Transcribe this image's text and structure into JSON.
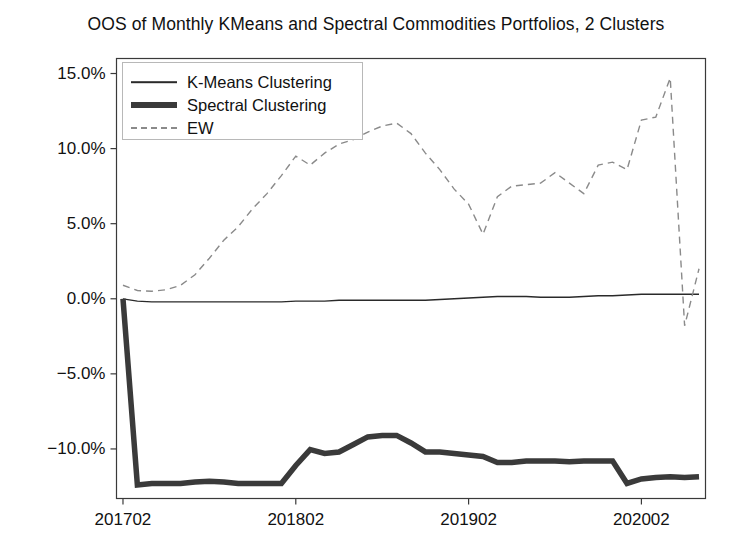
{
  "chart_data": {
    "type": "line",
    "title": "OOS of Monthly KMeans and Spectral Commodities Portfolios, 2 Clusters",
    "xlabel": "",
    "ylabel": "",
    "grid": false,
    "legend_position": "upper left",
    "xlim": [
      201701,
      202006
    ],
    "ylim": [
      -13.3,
      16.0
    ],
    "ytick_labels": [
      "15.0%",
      "10.0%",
      "5.0%",
      "0.0%",
      "−5.0%",
      "−10.0%"
    ],
    "ytick_values": [
      15.0,
      10.0,
      5.0,
      0.0,
      -5.0,
      -10.0
    ],
    "xtick_labels": [
      "201702",
      "201802",
      "201902",
      "202002"
    ],
    "xtick_values": [
      201702,
      201802,
      201902,
      202002
    ],
    "x": [
      "201702",
      "201703",
      "201704",
      "201705",
      "201706",
      "201707",
      "201708",
      "201709",
      "201710",
      "201711",
      "201712",
      "201801",
      "201802",
      "201803",
      "201804",
      "201805",
      "201806",
      "201807",
      "201808",
      "201809",
      "201810",
      "201811",
      "201812",
      "201901",
      "201902",
      "201903",
      "201904",
      "201905",
      "201906",
      "201907",
      "201908",
      "201909",
      "201910",
      "201911",
      "201912",
      "202001",
      "202002",
      "202003",
      "202004",
      "202005",
      "202006"
    ],
    "series": [
      {
        "name": "K-Means Clustering",
        "style": "solid",
        "width": 1.3,
        "color": "#2a2a2a",
        "values": [
          0.0,
          -0.15,
          -0.2,
          -0.2,
          -0.2,
          -0.2,
          -0.2,
          -0.2,
          -0.2,
          -0.2,
          -0.2,
          -0.2,
          -0.15,
          -0.15,
          -0.15,
          -0.1,
          -0.1,
          -0.1,
          -0.1,
          -0.1,
          -0.1,
          -0.1,
          -0.05,
          0.0,
          0.05,
          0.1,
          0.15,
          0.15,
          0.15,
          0.1,
          0.1,
          0.1,
          0.15,
          0.2,
          0.2,
          0.25,
          0.3,
          0.3,
          0.3,
          0.3,
          0.3
        ]
      },
      {
        "name": "Spectral Clustering",
        "style": "solid",
        "width": 5.5,
        "color": "#3a3a3a",
        "values": [
          0.0,
          -12.4,
          -12.3,
          -12.3,
          -12.3,
          -12.2,
          -12.15,
          -12.2,
          -12.3,
          -12.3,
          -12.3,
          -12.3,
          -11.1,
          -10.05,
          -10.3,
          -10.2,
          -9.7,
          -9.2,
          -9.1,
          -9.1,
          -9.6,
          -10.2,
          -10.2,
          -10.3,
          -10.4,
          -10.5,
          -10.9,
          -10.9,
          -10.8,
          -10.8,
          -10.8,
          -10.85,
          -10.8,
          -10.8,
          -10.8,
          -12.3,
          -12.0,
          -11.9,
          -11.85,
          -11.9,
          -11.85
        ]
      },
      {
        "name": "EW",
        "style": "dashed",
        "width": 1.4,
        "color": "#8a8a8a",
        "values": [
          0.9,
          0.55,
          0.5,
          0.6,
          0.9,
          1.6,
          2.7,
          3.9,
          4.8,
          6.0,
          7.0,
          8.2,
          9.5,
          8.9,
          9.7,
          10.3,
          10.6,
          11.1,
          11.5,
          11.7,
          11.0,
          9.7,
          8.6,
          7.3,
          6.3,
          4.3,
          6.8,
          7.5,
          7.6,
          7.7,
          8.4,
          7.7,
          7.0,
          8.9,
          9.1,
          8.6,
          11.9,
          12.1,
          14.7,
          -1.8,
          2.0
        ]
      }
    ]
  },
  "legend": {
    "items": [
      {
        "label": "K-Means Clustering",
        "style": "solid-thin"
      },
      {
        "label": "Spectral Clustering",
        "style": "solid-thick"
      },
      {
        "label": "EW",
        "style": "dashed"
      }
    ]
  },
  "axes": {
    "spine_color": "#3a3a3a",
    "tick_color": "#3a3a3a"
  }
}
